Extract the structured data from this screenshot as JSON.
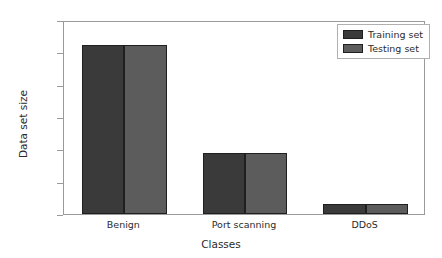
{
  "chart_data": {
    "type": "bar",
    "title": "",
    "xlabel": "Classes",
    "ylabel": "Data set size",
    "categories": [
      "Benign",
      "Port scanning",
      "DDoS"
    ],
    "series": [
      {
        "name": "Training set",
        "color": "#3a3a3a",
        "values": [
          112200,
          78800,
          63200
        ]
      },
      {
        "name": "Testing set",
        "color": "#5c5c5c",
        "values": [
          112200,
          78800,
          63200
        ]
      }
    ],
    "ylim": [
      60000,
      120000
    ],
    "yticks": [
      60000,
      70000,
      80000,
      90000,
      100000,
      110000,
      120000
    ],
    "ytick_labels": [
      "60000",
      "70000",
      "80000",
      "90000",
      "100000",
      "110000",
      "120000"
    ],
    "grid": false,
    "legend_position": "upper right"
  },
  "legend": {
    "entries": [
      {
        "label": "Training set"
      },
      {
        "label": "Testing set"
      }
    ]
  }
}
